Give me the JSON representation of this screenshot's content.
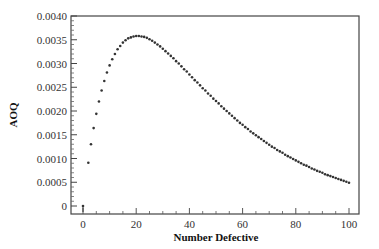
{
  "chart_data": {
    "type": "scatter",
    "title": "",
    "xlabel": "Number Defective",
    "ylabel": "AOQ",
    "xlim": [
      -4,
      104
    ],
    "ylim": [
      -0.00016,
      0.004
    ],
    "x_ticks": [
      0,
      20,
      40,
      60,
      80,
      100
    ],
    "x_tick_labels": [
      "0",
      "20",
      "40",
      "60",
      "80",
      "100"
    ],
    "y_ticks": [
      0,
      0.0005,
      0.001,
      0.0015,
      0.002,
      0.0025,
      0.003,
      0.0035,
      0.004
    ],
    "y_tick_labels": [
      "0",
      "0.0005",
      "0.0010",
      "0.0015",
      "0.0020",
      "0.0025",
      "0.0030",
      "0.0035",
      "0.0040"
    ],
    "grid": false,
    "legend": null,
    "marker_color": "#333333",
    "series": [
      {
        "name": "AOQ",
        "x": [
          0,
          2,
          3,
          4,
          5,
          6,
          7,
          8,
          9,
          10,
          11,
          12,
          13,
          14,
          15,
          16,
          17,
          18,
          19,
          20,
          21,
          22,
          23,
          24,
          25,
          26,
          27,
          28,
          29,
          30,
          31,
          32,
          33,
          34,
          35,
          36,
          37,
          38,
          39,
          40,
          41,
          42,
          43,
          44,
          45,
          46,
          47,
          48,
          49,
          50,
          51,
          52,
          53,
          54,
          55,
          56,
          57,
          58,
          59,
          60,
          61,
          62,
          63,
          64,
          65,
          66,
          67,
          68,
          69,
          70,
          71,
          72,
          73,
          74,
          75,
          76,
          77,
          78,
          79,
          80,
          81,
          82,
          83,
          84,
          85,
          86,
          87,
          88,
          89,
          90,
          91,
          92,
          93,
          94,
          95,
          96,
          97,
          98,
          99,
          100
        ],
        "values": [
          0,
          0.00091,
          0.0013,
          0.00164,
          0.00194,
          0.0022,
          0.00243,
          0.00263,
          0.00281,
          0.00296,
          0.00309,
          0.0032,
          0.0033,
          0.00337,
          0.00344,
          0.00349,
          0.00353,
          0.00355,
          0.00357,
          0.00358,
          0.00358,
          0.00357,
          0.00356,
          0.00354,
          0.00351,
          0.00348,
          0.00344,
          0.0034,
          0.00336,
          0.00331,
          0.00326,
          0.00321,
          0.00316,
          0.00311,
          0.00305,
          0.003,
          0.00294,
          0.00288,
          0.00283,
          0.00277,
          0.00271,
          0.00265,
          0.0026,
          0.00254,
          0.00248,
          0.00243,
          0.00237,
          0.00232,
          0.00226,
          0.00221,
          0.00216,
          0.0021,
          0.00205,
          0.002,
          0.00195,
          0.0019,
          0.00185,
          0.0018,
          0.00175,
          0.00171,
          0.00166,
          0.00162,
          0.00157,
          0.00153,
          0.00149,
          0.00145,
          0.00141,
          0.00137,
          0.00133,
          0.00129,
          0.00125,
          0.00122,
          0.00118,
          0.00115,
          0.00112,
          0.00108,
          0.00105,
          0.00102,
          0.00099,
          0.00096,
          0.00093,
          0.0009,
          0.00087,
          0.00085,
          0.00082,
          0.00079,
          0.00077,
          0.00074,
          0.00072,
          0.0007,
          0.00067,
          0.00065,
          0.00063,
          0.00061,
          0.00059,
          0.00057,
          0.00055,
          0.00053,
          0.00051,
          0.00049
        ]
      }
    ]
  }
}
